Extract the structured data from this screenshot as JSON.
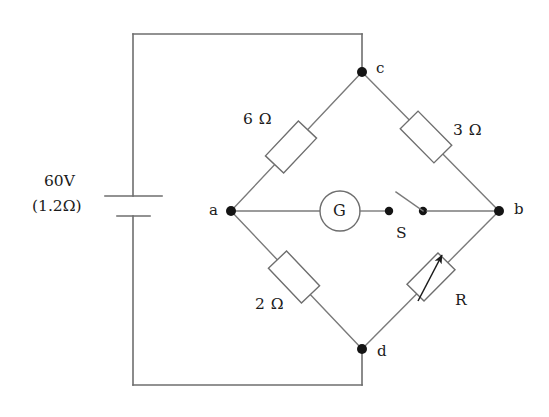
{
  "diagram": {
    "line_color": "#6e6e6e",
    "node_color": "#141414",
    "background": "#ffffff"
  },
  "source": {
    "voltage_label": "60V",
    "internal_resistance_label": "(1.2Ω)",
    "symbol": "battery-cell"
  },
  "nodes": [
    {
      "id": "c",
      "label": "c",
      "position": "top"
    },
    {
      "id": "a",
      "label": "a",
      "position": "left"
    },
    {
      "id": "b",
      "label": "b",
      "position": "right"
    },
    {
      "id": "d",
      "label": "d",
      "position": "bottom"
    }
  ],
  "components": [
    {
      "id": "r-ac",
      "type": "resistor",
      "label": "6 Ω",
      "value": 6,
      "unit": "Ω",
      "branch": "a-c"
    },
    {
      "id": "r-cb",
      "type": "resistor",
      "label": "3 Ω",
      "value": 3,
      "unit": "Ω",
      "branch": "c-b"
    },
    {
      "id": "r-ad",
      "type": "resistor",
      "label": "2 Ω",
      "value": 2,
      "unit": "Ω",
      "branch": "a-d"
    },
    {
      "id": "r-db",
      "type": "variable-resistor",
      "label": "R",
      "value": null,
      "unit": "Ω",
      "branch": "d-b"
    },
    {
      "id": "galvanometer",
      "type": "galvanometer",
      "label": "G",
      "branch": "a-b bridge"
    },
    {
      "id": "switch",
      "type": "switch",
      "label": "S",
      "state": "open",
      "branch": "a-b bridge"
    }
  ]
}
